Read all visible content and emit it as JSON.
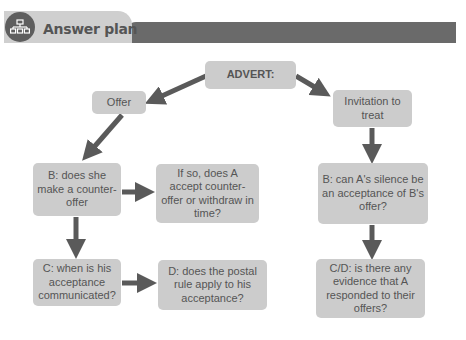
{
  "header": {
    "title": "Answer plan",
    "icon": "hierarchy-icon"
  },
  "diagram": {
    "nodes": {
      "advert": "ADVERT:",
      "offer": "Offer",
      "invitation": "Invitation to treat",
      "b_counter_offer": "B: does she make a counter-offer",
      "if_so": "If so, does A accept counter-offer or withdraw in time?",
      "c_acceptance": "C: when is his acceptance communicated?",
      "d_postal_rule": "D: does the postal rule apply to his acceptance?",
      "b_silence": "B: can A's silence be an acceptance of B's offer?",
      "cd_evidence": "C/D: is there any evidence that A responded to their offers?"
    },
    "edges": [
      {
        "from": "advert",
        "to": "offer"
      },
      {
        "from": "advert",
        "to": "invitation"
      },
      {
        "from": "offer",
        "to": "b_counter_offer"
      },
      {
        "from": "b_counter_offer",
        "to": "if_so"
      },
      {
        "from": "b_counter_offer",
        "to": "c_acceptance"
      },
      {
        "from": "c_acceptance",
        "to": "d_postal_rule"
      },
      {
        "from": "invitation",
        "to": "b_silence"
      },
      {
        "from": "b_silence",
        "to": "cd_evidence"
      }
    ],
    "colors": {
      "box": "#cccccc",
      "arrow": "#5a5a5a",
      "text": "#555555"
    }
  }
}
